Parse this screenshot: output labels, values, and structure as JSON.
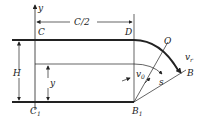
{
  "diagram": {
    "labels": {
      "y_axis": "y",
      "half_width": "C/2",
      "C": "C",
      "D": "D",
      "O": "O",
      "v_r": "v",
      "v_r_sub": "r",
      "B": "B",
      "H": "H",
      "y": "y",
      "v0": "v",
      "v0_sub": "0",
      "s": "s",
      "C1": "C",
      "C1_sub": "1",
      "B1": "B",
      "B1_sub": "1"
    },
    "colors": {
      "line": "#222222",
      "background": "#ffffff"
    }
  }
}
